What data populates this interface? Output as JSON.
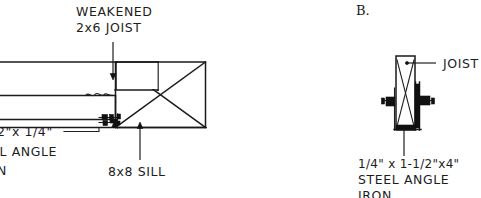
{
  "figure": {
    "title_visible": false,
    "background_color": "#ffffff",
    "ink_color": "#1a1a1a"
  },
  "panels": [
    {
      "id": "panel-a",
      "letter": "",
      "view": "side elevation of weakened joist bearing on sill with steel angle iron reinforcement",
      "labels": {
        "joist_callout_line1": "WEAKENED",
        "joist_callout_line2": "2x6 JOIST",
        "sill_callout": "8x8 SILL",
        "angle_callout_line1": "2\"x 1/4\"",
        "angle_callout_line2": "EL ANGLE",
        "angle_callout_line3": "N"
      }
    },
    {
      "id": "panel-b",
      "letter": "B.",
      "view": "end section of joist with steel angle iron brackets on both faces",
      "labels": {
        "joist_callout": "JOIST",
        "angle_callout_line1": "1/4\" x 1-1/2\"x4\"",
        "angle_callout_line2": "STEEL ANGLE",
        "angle_callout_line3": "IRON"
      }
    }
  ],
  "icons": {
    "arrow_leader": "arrow-leader-icon",
    "break_line": "squiggle-break-icon",
    "x_hatch": "timber-section-x-icon"
  }
}
